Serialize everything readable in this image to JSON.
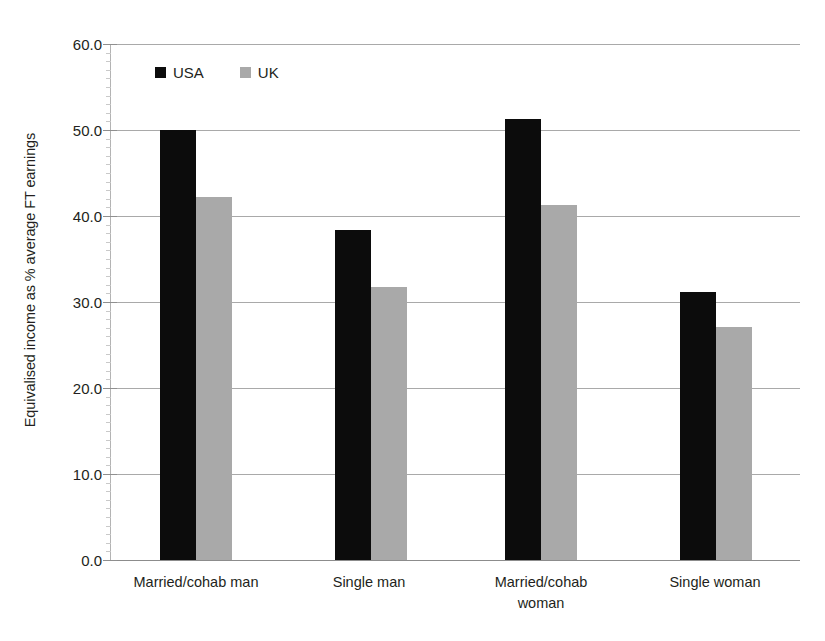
{
  "chart_data": {
    "type": "bar",
    "title": "",
    "subtitle": "",
    "xlabel": "",
    "ylabel": "Equivalised income as % average FT earnings",
    "ylim": [
      0.0,
      60.0
    ],
    "ytick_step": 10.0,
    "ytick_labels": [
      "60.0",
      "50.0",
      "40.0",
      "30.0",
      "20.0",
      "10.0",
      "0.0"
    ],
    "ytick_values": [
      60.0,
      50.0,
      40.0,
      30.0,
      20.0,
      10.0,
      0.0
    ],
    "grid": true,
    "grid_axis": "y",
    "legend_position": "top-left-inside",
    "categories": [
      "Married/cohab man",
      "Single man",
      "Married/cohab\nwoman",
      "Single woman"
    ],
    "category_labels": [
      [
        "Married/cohab man"
      ],
      [
        "Single man"
      ],
      [
        "Married/cohab",
        "woman"
      ],
      [
        "Single woman"
      ]
    ],
    "series": [
      {
        "name": "USA",
        "color": "#0c0c0c",
        "values": [
          50.0,
          38.4,
          51.3,
          31.2
        ]
      },
      {
        "name": "UK",
        "color": "#a9a9a9",
        "values": [
          42.2,
          31.7,
          41.3,
          27.1
        ]
      }
    ],
    "annotations": []
  },
  "legend": {
    "entries": [
      {
        "label": "USA",
        "swatch": "black-square-swatch"
      },
      {
        "label": "UK",
        "swatch": "gray-square-swatch"
      }
    ]
  },
  "colors": {
    "usa_bar": "#0c0c0c",
    "uk_bar": "#a9a9a9",
    "gridline": "#a9a9a9",
    "axis": "#b3b3b3",
    "text": "#231f20",
    "background": "#ffffff"
  }
}
